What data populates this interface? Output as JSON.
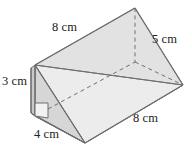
{
  "figure": {
    "name": "triangular-prism",
    "right_angle_marker": true,
    "colors": {
      "stroke": "#6f6f6f",
      "text": "#222222",
      "top_face_fill": "#e2e2e2",
      "front_face_fill": "#ececec",
      "end_face_fill": "#d8d8d8",
      "side_strip_fill": "#cfcfcf",
      "background": "#ffffff"
    },
    "labels": {
      "top_slant": "8 cm",
      "right_slant": "5 cm",
      "left_height": "3 cm",
      "bottom_length": "8 cm",
      "base_width": "4 cm"
    }
  }
}
